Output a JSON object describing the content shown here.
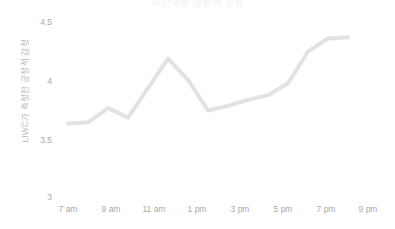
{
  "chart_data": {
    "type": "line",
    "title": "시간대별 긍정적 감정",
    "xlabel": "",
    "ylabel": "LIWC가 측정한 긍정적 감정",
    "x": [
      "7 am",
      "8 am",
      "9 am",
      "10 am",
      "11 am",
      "12 pm",
      "1 pm",
      "2 pm",
      "3 pm",
      "4 pm",
      "5 pm",
      "6 pm",
      "7 pm",
      "8 pm",
      "9 pm"
    ],
    "values": [
      3.64,
      3.65,
      3.77,
      3.69,
      3.94,
      4.19,
      4.01,
      3.75,
      3.79,
      3.84,
      3.88,
      3.98,
      4.25,
      4.36,
      4.37
    ],
    "series": [
      {
        "name": "긍정적 감정",
        "color": "#e2e2e4",
        "values": [
          3.64,
          3.65,
          3.77,
          3.69,
          3.94,
          4.19,
          4.01,
          3.75,
          3.79,
          3.84,
          3.88,
          3.98,
          4.25,
          4.36,
          4.37
        ]
      }
    ],
    "x_tick_labels": [
      "7 am",
      "9 am",
      "11 am",
      "1 pm",
      "3 pm",
      "5 pm",
      "7 pm",
      "9 pm"
    ],
    "x_tick_values": [
      7,
      9,
      11,
      13,
      15,
      17,
      19,
      21
    ],
    "y_tick_labels": [
      "4.5",
      "4",
      "3.5",
      "3"
    ],
    "y_tick_values": [
      4.5,
      4.0,
      3.5,
      3.0
    ],
    "xlim": [
      6.5,
      21.5
    ],
    "ylim": [
      3.0,
      4.5
    ],
    "grid": false,
    "legend": "none",
    "line_width": 4,
    "colors": {
      "line": "#e2e2e4",
      "tick_label": "#a9a9ad",
      "axis_title": "#b9b9bd",
      "title": "#f0f0f2",
      "background": "#ffffff"
    }
  }
}
